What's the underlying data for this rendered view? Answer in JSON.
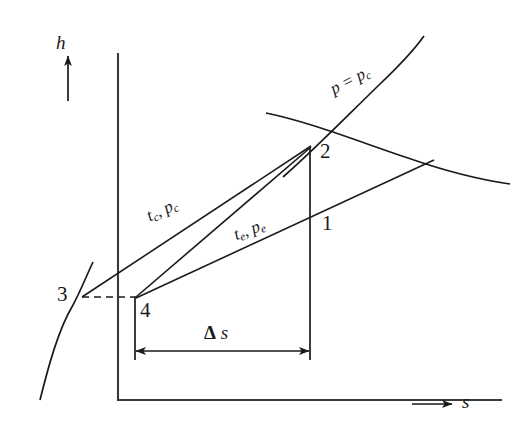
{
  "figure": {
    "type": "h-s diagram (Mollier chart) for a compression cycle",
    "background_color": "#ffffff",
    "line_color": "#1a1a1a",
    "width": 526,
    "height": 423
  },
  "axes": {
    "y": {
      "symbol": "h",
      "arrow": "up",
      "x": 118,
      "y_top": 55,
      "y_bottom": 400
    },
    "x": {
      "symbol": "s",
      "arrow": "right",
      "y": 400,
      "x_left": 118,
      "x_right": 500
    }
  },
  "curves": {
    "critical_isobar": {
      "label": "p = pᴄ",
      "label_p": "p",
      "label_eq": " = ",
      "label_p2": "p",
      "label_sub": "c",
      "label_x": 336,
      "label_y": 95,
      "rotation_deg": -27
    },
    "saturation_vapor": {
      "name": "saturated-vapour-curve",
      "note": "concave-down curve descending to the right"
    },
    "saturation_liquid": {
      "name": "saturated-liquid-curve",
      "note": "steep curve rising from origin through point 3"
    }
  },
  "processes": [
    {
      "name": "compression-3-to-2",
      "label": "tᴄ, pᴄ",
      "label_t": "t",
      "label_t_sub": "c",
      "label_sep": ", ",
      "label_p": "p",
      "label_p_sub": "c",
      "label_x": 152,
      "label_y": 222,
      "rotation_deg": -25
    },
    {
      "name": "compression-4-to-1",
      "label": "tₑ, pₑ",
      "label_t": "t",
      "label_t_sub": "e",
      "label_sep": ", ",
      "label_p": "p",
      "label_p_sub": "e",
      "label_x": 238,
      "label_y": 240,
      "rotation_deg": -21
    }
  ],
  "points": [
    {
      "id": "1",
      "label": "1",
      "x": 330,
      "y": 215,
      "px": 310,
      "py": 228
    },
    {
      "id": "2",
      "label": "2",
      "x": 325,
      "y": 145,
      "px": 310,
      "py": 150
    },
    {
      "id": "3",
      "label": "3",
      "x": 63,
      "y": 292,
      "px": 82,
      "py": 297
    },
    {
      "id": "4",
      "label": "4",
      "x": 142,
      "y": 306,
      "px": 135,
      "py": 297
    }
  ],
  "dimension": {
    "name": "entropy-difference",
    "label_delta": "Δ",
    "label_s": "s",
    "label": "Δ s",
    "label_x": 212,
    "label_y": 331,
    "arrow_y": 351,
    "x_from": 135,
    "x_to": 310
  },
  "annotations": {
    "dashed_connector": {
      "name": "dashed-line-3-to-4",
      "from_x": 82,
      "from_y": 297,
      "to_x": 135,
      "to_y": 297
    }
  }
}
